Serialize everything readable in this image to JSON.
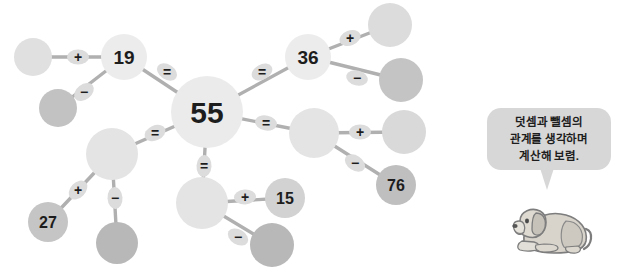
{
  "page": {
    "background_color": "#ffffff",
    "width": 627,
    "height": 267
  },
  "palette": {
    "node_light": "#e6e6e6",
    "node_lighter": "#eeeeee",
    "node_mid": "#d9d9d9",
    "node_dark": "#bfbfbf",
    "node_darker": "#b5b5b5",
    "edge": "#b0b0b0",
    "operator_chip": "#dcdcdc",
    "operator_text": "#1d1d1d",
    "number_text": "#1d1d1d",
    "bubble_fill": "#d7d7d7",
    "bubble_text": "#1d1d1d"
  },
  "diagram": {
    "type": "number-relation-network",
    "nodes": [
      {
        "id": "n_left_blank",
        "label": "",
        "cx": 33,
        "cy": 57,
        "r": 19,
        "fill": "#e0e0e0",
        "filled": false
      },
      {
        "id": "n_19",
        "label": "19",
        "cx": 124,
        "cy": 57,
        "r": 23,
        "fill": "#ececec",
        "filled": true
      },
      {
        "id": "n_lower_left_blank",
        "label": "",
        "cx": 58,
        "cy": 108,
        "r": 19,
        "fill": "#c2c2c2",
        "filled": false
      },
      {
        "id": "n_55",
        "label": "55",
        "cx": 207,
        "cy": 112,
        "r": 36,
        "fill": "#ebebeb",
        "filled": true
      },
      {
        "id": "n_36",
        "label": "36",
        "cx": 308,
        "cy": 57,
        "r": 23,
        "fill": "#ececec",
        "filled": true
      },
      {
        "id": "n_tr_blank",
        "label": "",
        "cx": 390,
        "cy": 25,
        "r": 22,
        "fill": "#dcdcdc",
        "filled": false
      },
      {
        "id": "n_r_blank_dark",
        "label": "",
        "cx": 401,
        "cy": 80,
        "r": 22,
        "fill": "#c4c4c4",
        "filled": false
      },
      {
        "id": "n_mr_blank",
        "label": "",
        "cx": 314,
        "cy": 133,
        "r": 25,
        "fill": "#e4e4e4",
        "filled": false
      },
      {
        "id": "n_mr_right_blank",
        "label": "",
        "cx": 404,
        "cy": 132,
        "r": 22,
        "fill": "#d9d9d9",
        "filled": false
      },
      {
        "id": "n_76",
        "label": "76",
        "cx": 396,
        "cy": 185,
        "r": 20,
        "fill": "#bfbfbf",
        "filled": true
      },
      {
        "id": "n_bl_blank",
        "label": "",
        "cx": 112,
        "cy": 154,
        "r": 26,
        "fill": "#e4e4e4",
        "filled": false
      },
      {
        "id": "n_27",
        "label": "27",
        "cx": 48,
        "cy": 222,
        "r": 20,
        "fill": "#c5c5c5",
        "filled": true
      },
      {
        "id": "n_bl_down_blank",
        "label": "",
        "cx": 117,
        "cy": 243,
        "r": 21,
        "fill": "#b8b8b8",
        "filled": false
      },
      {
        "id": "n_bc_blank",
        "label": "",
        "cx": 202,
        "cy": 203,
        "r": 26,
        "fill": "#e4e4e4",
        "filled": false
      },
      {
        "id": "n_15",
        "label": "15",
        "cx": 285,
        "cy": 198,
        "r": 20,
        "fill": "#d2d2d2",
        "filled": true
      },
      {
        "id": "n_bc_down_blank",
        "label": "",
        "cx": 272,
        "cy": 245,
        "r": 22,
        "fill": "#b8b8b8",
        "filled": false
      }
    ],
    "edges": [
      {
        "from": "n_left_blank",
        "to": "n_19",
        "operator": "+",
        "ox": 78,
        "oy": 57
      },
      {
        "from": "n_19",
        "to": "n_lower_left_blank",
        "operator": "-",
        "ox": 84,
        "oy": 92
      },
      {
        "from": "n_19",
        "to": "n_55",
        "operator": "=",
        "ox": 167,
        "oy": 72
      },
      {
        "from": "n_55",
        "to": "n_36",
        "operator": "=",
        "ox": 262,
        "oy": 72
      },
      {
        "from": "n_36",
        "to": "n_tr_blank",
        "operator": "+",
        "ox": 350,
        "oy": 38
      },
      {
        "from": "n_36",
        "to": "n_r_blank_dark",
        "operator": "-",
        "ox": 357,
        "oy": 78
      },
      {
        "from": "n_55",
        "to": "n_mr_blank",
        "operator": "=",
        "ox": 266,
        "oy": 123
      },
      {
        "from": "n_mr_blank",
        "to": "n_mr_right_blank",
        "operator": "+",
        "ox": 360,
        "oy": 132
      },
      {
        "from": "n_mr_blank",
        "to": "n_76",
        "operator": "-",
        "ox": 355,
        "oy": 163
      },
      {
        "from": "n_55",
        "to": "n_bl_blank",
        "operator": "=",
        "ox": 155,
        "oy": 133
      },
      {
        "from": "n_bl_blank",
        "to": "n_27",
        "operator": "+",
        "ox": 78,
        "oy": 190
      },
      {
        "from": "n_bl_blank",
        "to": "n_bl_down_blank",
        "operator": "-",
        "ox": 115,
        "oy": 198
      },
      {
        "from": "n_55",
        "to": "n_bc_blank",
        "operator": "=",
        "ox": 204,
        "oy": 166
      },
      {
        "from": "n_bc_blank",
        "to": "n_15",
        "operator": "+",
        "ox": 245,
        "oy": 197
      },
      {
        "from": "n_bc_blank",
        "to": "n_bc_down_blank",
        "operator": "-",
        "ox": 238,
        "oy": 237
      }
    ],
    "numbers_shown": [
      "19",
      "55",
      "36",
      "76",
      "27",
      "15"
    ],
    "operators_shown": [
      "+",
      "-",
      "="
    ]
  },
  "speech_bubble": {
    "line1": "덧셈과 뺄셈의",
    "line2": "관계를 생각하며",
    "line3": "계산해 보렴."
  },
  "mascot": {
    "name": "dog-illustration",
    "alt": "puppy"
  },
  "top_clipped_text": ""
}
